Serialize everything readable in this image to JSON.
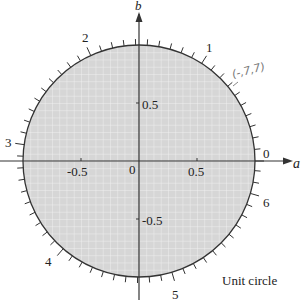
{
  "figure": {
    "title": "Unit circle",
    "axis_labels": {
      "horizontal": "a",
      "vertical": "b"
    },
    "axis_ticks": {
      "horizontal": [
        "-0.5",
        "0",
        "0.5"
      ],
      "vertical": [
        "0.5",
        "-0.5"
      ]
    },
    "circle_marks": [
      "0",
      "1",
      "2",
      "3",
      "4",
      "5",
      "6"
    ],
    "annotation": "(-,7,7)",
    "colors": {
      "fill": "#d6d6d6",
      "grid": "#f0f0f0",
      "stroke": "#333333"
    }
  }
}
